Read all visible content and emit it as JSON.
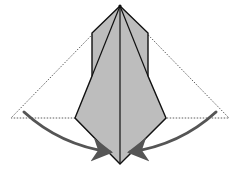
{
  "diagram": {
    "type": "origami-fold-step",
    "colors": {
      "paper_fill": "#bdbdbd",
      "outline": "#111111",
      "dotted_guide": "#333333",
      "arrow": "#555555",
      "background": "#ffffff"
    },
    "shapes": {
      "guide_triangle": [
        [
          120,
          6
        ],
        [
          11,
          118
        ],
        [
          229,
          118
        ]
      ],
      "paper_outline": [
        [
          120,
          6
        ],
        [
          148,
          33
        ],
        [
          148,
          76
        ],
        [
          166,
          118
        ],
        [
          120,
          164
        ],
        [
          75,
          118
        ],
        [
          92,
          76
        ],
        [
          92,
          33
        ]
      ],
      "center_line": [
        [
          120,
          6
        ],
        [
          120,
          164
        ]
      ],
      "left_diagonal": [
        [
          120,
          6
        ],
        [
          92,
          76
        ]
      ],
      "right_diagonal": [
        [
          120,
          6
        ],
        [
          148,
          76
        ]
      ]
    },
    "arrows": [
      {
        "name": "left-fold-arrow",
        "from": [
          24,
          112
        ],
        "to": [
          112,
          153
        ]
      },
      {
        "name": "right-fold-arrow",
        "from": [
          216,
          112
        ],
        "to": [
          128,
          153
        ]
      }
    ]
  }
}
